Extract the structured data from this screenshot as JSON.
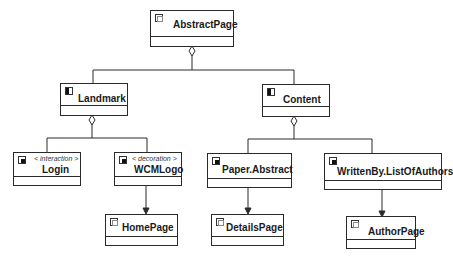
{
  "diagram": {
    "root": {
      "name": "AbstractPage",
      "icon": "page-icon"
    },
    "areas": [
      {
        "name": "Landmark",
        "icon": "area-icon"
      },
      {
        "name": "Content",
        "icon": "area-icon"
      }
    ],
    "units": [
      {
        "name": "Login",
        "stereotype": "< interaction >",
        "icon": "unit-icon"
      },
      {
        "name": "WCMLogo",
        "stereotype": "< decoration >",
        "icon": "unit-icon"
      },
      {
        "name": "Paper.Abstract",
        "stereotype": "",
        "icon": "unit-icon"
      },
      {
        "name": "WrittenBy.ListOfAuthors",
        "stereotype": "",
        "icon": "unit-icon"
      }
    ],
    "pages": [
      {
        "name": "HomePage",
        "icon": "page-icon"
      },
      {
        "name": "DetailsPage",
        "icon": "page-icon"
      },
      {
        "name": "AuthorPage",
        "icon": "page-icon"
      }
    ],
    "relations": [
      {
        "from": "AbstractPage",
        "to": "Landmark",
        "type": "aggregation"
      },
      {
        "from": "AbstractPage",
        "to": "Content",
        "type": "aggregation"
      },
      {
        "from": "Landmark",
        "to": "Login",
        "type": "aggregation"
      },
      {
        "from": "Landmark",
        "to": "WCMLogo",
        "type": "aggregation"
      },
      {
        "from": "Content",
        "to": "Paper.Abstract",
        "type": "aggregation"
      },
      {
        "from": "Content",
        "to": "WrittenBy.ListOfAuthors",
        "type": "aggregation"
      },
      {
        "from": "WCMLogo",
        "to": "HomePage",
        "type": "navigation"
      },
      {
        "from": "Paper.Abstract",
        "to": "DetailsPage",
        "type": "navigation"
      },
      {
        "from": "WrittenBy.ListOfAuthors",
        "to": "AuthorPage",
        "type": "navigation"
      }
    ]
  }
}
